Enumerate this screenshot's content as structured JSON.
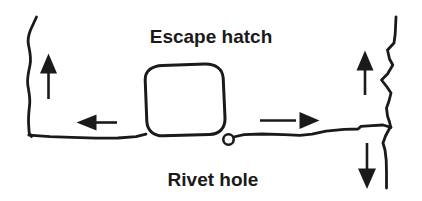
{
  "diagram": {
    "background_color": "#ffffff",
    "ink_color": "#1a1a1a",
    "labels": {
      "escape_hatch": "Escape hatch",
      "rivet_hole": "Rivet hole"
    },
    "parts": {
      "left_crack_name": "left fuselage crack",
      "right_crack_name": "right fuselage crack",
      "seam_name": "horizontal fuselage seam",
      "hatch_name": "escape hatch outline",
      "hole_name": "rivet hole"
    },
    "arrows": {
      "left_up": "up",
      "left_horizontal": "left",
      "right_horizontal": "right",
      "right_up": "up",
      "right_down": "down"
    }
  }
}
